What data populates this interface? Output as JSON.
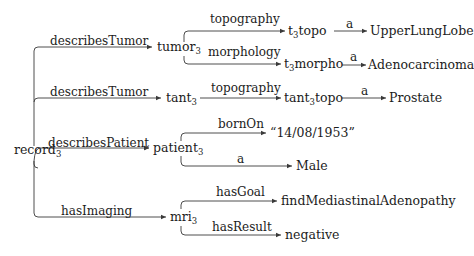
{
  "diagram": {
    "type": "rdf-graph",
    "root": {
      "id": "record",
      "label": "record",
      "subscript": "3"
    },
    "nodes": {
      "record": {
        "label": "record",
        "subscript": "3"
      },
      "tumor": {
        "label": "tumor",
        "subscript": "3"
      },
      "tant": {
        "label": "tant",
        "subscript": "3"
      },
      "patient": {
        "label": "patient",
        "subscript": "3"
      },
      "mri": {
        "label": "mri",
        "subscript": "3"
      },
      "t3topo": {
        "prefix": "t",
        "subscript": "3",
        "suffix": "topo"
      },
      "t3morpho": {
        "prefix": "t",
        "subscript": "3",
        "suffix": "morpho"
      },
      "tant3topo": {
        "prefix": "tant",
        "subscript": "3",
        "suffix": "topo"
      },
      "upperLungLobe": {
        "label": "UpperLungLobe"
      },
      "adenocarcinoma": {
        "label": "Adenocarcinoma"
      },
      "prostate": {
        "label": "Prostate"
      },
      "birthDate": {
        "label": "“14/08/1953”"
      },
      "male": {
        "label": "Male"
      },
      "findMediastinalAdenopathy": {
        "label": "findMediastinalAdenopathy"
      },
      "negative": {
        "label": "negative"
      }
    },
    "edges": [
      {
        "from": "record",
        "to": "tumor",
        "label": "describesTumor"
      },
      {
        "from": "record",
        "to": "tant",
        "label": "describesTumor"
      },
      {
        "from": "record",
        "to": "patient",
        "label": "describesPatient"
      },
      {
        "from": "record",
        "to": "mri",
        "label": "hasImaging"
      },
      {
        "from": "tumor",
        "to": "t3topo",
        "label": "topography"
      },
      {
        "from": "tumor",
        "to": "t3morpho",
        "label": "morphology"
      },
      {
        "from": "t3topo",
        "to": "upperLungLobe",
        "label": "a"
      },
      {
        "from": "t3morpho",
        "to": "adenocarcinoma",
        "label": "a"
      },
      {
        "from": "tant",
        "to": "tant3topo",
        "label": "topography"
      },
      {
        "from": "tant3topo",
        "to": "prostate",
        "label": "a"
      },
      {
        "from": "patient",
        "to": "birthDate",
        "label": "bornOn"
      },
      {
        "from": "patient",
        "to": "male",
        "label": "a"
      },
      {
        "from": "mri",
        "to": "findMediastinalAdenopathy",
        "label": "hasGoal"
      },
      {
        "from": "mri",
        "to": "negative",
        "label": "hasResult"
      }
    ],
    "colors": {
      "line": "#3a3a3a",
      "text": "#1c1c1c",
      "background": "#ffffff"
    }
  }
}
